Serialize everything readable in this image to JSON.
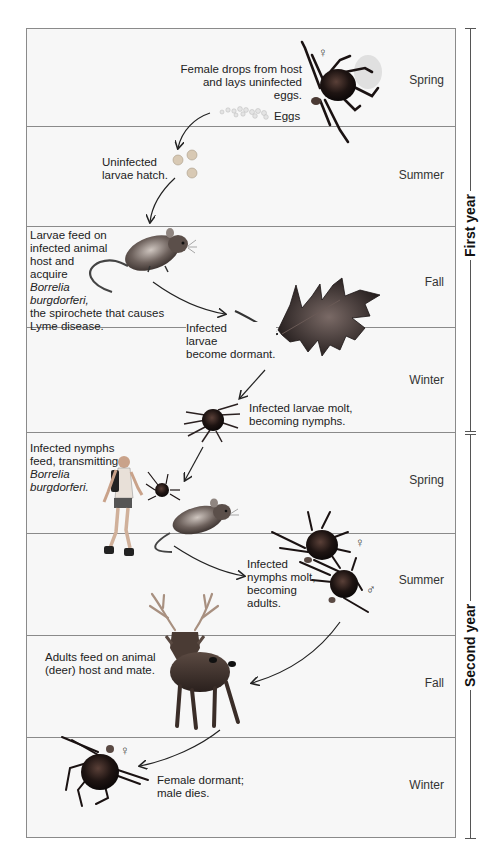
{
  "diagram": {
    "years": [
      {
        "label": "First year",
        "seasons": [
          "Spring",
          "Summer",
          "Fall",
          "Winter"
        ]
      },
      {
        "label": "Second year",
        "seasons": [
          "Spring",
          "Summer",
          "Fall",
          "Winter"
        ]
      }
    ],
    "seasons": {
      "y1_spring": "Spring",
      "y1_summer": "Summer",
      "y1_fall": "Fall",
      "y1_winter": "Winter",
      "y2_spring": "Spring",
      "y2_summer": "Summer",
      "y2_fall": "Fall",
      "y2_winter": "Winter"
    },
    "notes": {
      "female_drops_1": "Female drops from host",
      "female_drops_2": "and lays uninfected eggs.",
      "eggs": "Eggs",
      "larvae_hatch_1": "Uninfected",
      "larvae_hatch_2": "larvae hatch.",
      "larvae_feed_1": "Larvae feed on",
      "larvae_feed_2": "infected animal",
      "larvae_feed_3": "host and",
      "larvae_feed_4": "acquire",
      "larvae_feed_5": "Borrelia",
      "larvae_feed_6": "burgdorferi,",
      "larvae_feed_7": "the spirochete that causes",
      "larvae_feed_8": "Lyme disease.",
      "dormant_1": "Infected",
      "dormant_2": "larvae",
      "dormant_3": "become dormant.",
      "molt_1": "Infected larvae molt,",
      "molt_2": "becoming nymphs.",
      "nymph_feed_1": "Infected nymphs",
      "nymph_feed_2": "feed, transmitting",
      "nymph_feed_3": "Borrelia",
      "nymph_feed_4": "burgdorferi.",
      "nymph_molt_1": "Infected",
      "nymph_molt_2": "nymphs molt,",
      "nymph_molt_3": "becoming",
      "nymph_molt_4": "adults.",
      "adults_feed_1": "Adults feed on animal",
      "adults_feed_2": "(deer) host and mate.",
      "female_dormant_1": "Female dormant;",
      "female_dormant_2": "male dies."
    },
    "symbols": {
      "female": "♀",
      "male": "♂"
    },
    "illustrations": [
      "adult-female-tick-with-eggs",
      "eggs",
      "larvae",
      "mouse",
      "oak-leaf",
      "nymph-tick",
      "hiker",
      "nymph-tick-small",
      "mouse-2",
      "adult-female-tick",
      "adult-male-tick",
      "deer",
      "dormant-female-tick"
    ]
  }
}
